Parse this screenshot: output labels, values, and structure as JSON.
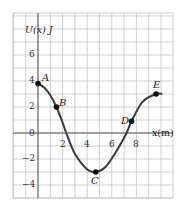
{
  "chart_data": {
    "type": "line",
    "title": "",
    "xlabel": "x(m)",
    "ylabel": "U(x) J",
    "xlim": [
      -2,
      11
    ],
    "ylim": [
      -5,
      9
    ],
    "grid": true,
    "x_ticks": [
      2,
      4,
      6,
      8
    ],
    "y_ticks": [
      -4,
      -2,
      0,
      2,
      4,
      6
    ],
    "series": [
      {
        "name": "U(x)",
        "x": [
          0,
          0.5,
          1,
          1.5,
          2,
          2.3,
          3,
          4,
          4.7,
          5.5,
          6.5,
          7.2,
          7.6,
          8.5,
          9.6,
          10.1
        ],
        "values": [
          3.8,
          3.5,
          2.9,
          2.0,
          0.8,
          0.0,
          -1.6,
          -2.8,
          -3.0,
          -2.6,
          -1.2,
          0.0,
          0.9,
          2.4,
          3.0,
          3.0
        ]
      }
    ],
    "points": [
      {
        "label": "A",
        "x": 0,
        "y": 3.8
      },
      {
        "label": "B",
        "x": 1.5,
        "y": 2.0
      },
      {
        "label": "C",
        "x": 4.7,
        "y": -3.0
      },
      {
        "label": "D",
        "x": 7.6,
        "y": 0.9
      },
      {
        "label": "E",
        "x": 9.6,
        "y": 3.0
      }
    ]
  },
  "labels": {
    "y_axis": "U(x) J",
    "x_axis": "x(m)",
    "tick_x_2": "2",
    "tick_x_4": "4",
    "tick_x_6": "6",
    "tick_x_8": "8",
    "tick_y_6": "6",
    "tick_y_4": "4",
    "tick_y_2": "2",
    "tick_y_0": "0",
    "tick_y_m2": "−2",
    "tick_y_m4": "−4",
    "point_A": "A",
    "point_B": "B",
    "point_C": "C",
    "point_D": "D",
    "point_E": "E"
  },
  "colors": {
    "grid": "#bdbdbd",
    "axis": "#555555",
    "curve": "#3a3a3a",
    "point": "#111111"
  }
}
